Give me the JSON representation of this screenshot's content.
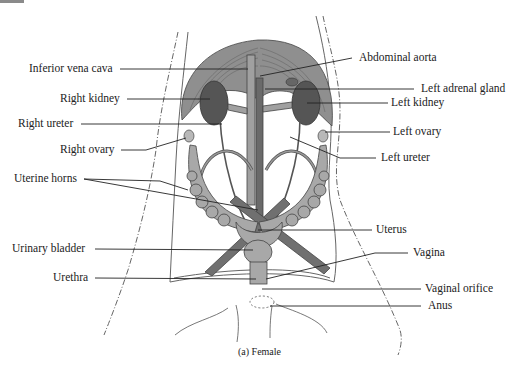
{
  "figure": {
    "caption": "(a) Female",
    "colors": {
      "diaphragm_muscle": "#8c8c8c",
      "kidney": "#555555",
      "vessel": "#9a9a9a",
      "uterus": "#a8a8a8",
      "leader_line": "#222222",
      "outline": "#555555",
      "background": "#ffffff"
    }
  },
  "labels": {
    "left": [
      {
        "id": "inferior-vena-cava",
        "text": "Inferior vena cava"
      },
      {
        "id": "right-kidney",
        "text": "Right kidney"
      },
      {
        "id": "right-ureter",
        "text": "Right ureter"
      },
      {
        "id": "right-ovary",
        "text": "Right ovary"
      },
      {
        "id": "uterine-horns",
        "text": "Uterine horns"
      },
      {
        "id": "urinary-bladder",
        "text": "Urinary bladder"
      },
      {
        "id": "urethra",
        "text": "Urethra"
      }
    ],
    "right": [
      {
        "id": "abdominal-aorta",
        "text": "Abdominal aorta"
      },
      {
        "id": "left-adrenal-gland",
        "text": "Left adrenal gland"
      },
      {
        "id": "left-kidney",
        "text": "Left kidney"
      },
      {
        "id": "left-ovary",
        "text": "Left ovary"
      },
      {
        "id": "left-ureter",
        "text": "Left ureter"
      },
      {
        "id": "uterus",
        "text": "Uterus"
      },
      {
        "id": "vagina",
        "text": "Vagina"
      },
      {
        "id": "vaginal-orifice",
        "text": "Vaginal orifice"
      },
      {
        "id": "anus",
        "text": "Anus"
      }
    ]
  }
}
